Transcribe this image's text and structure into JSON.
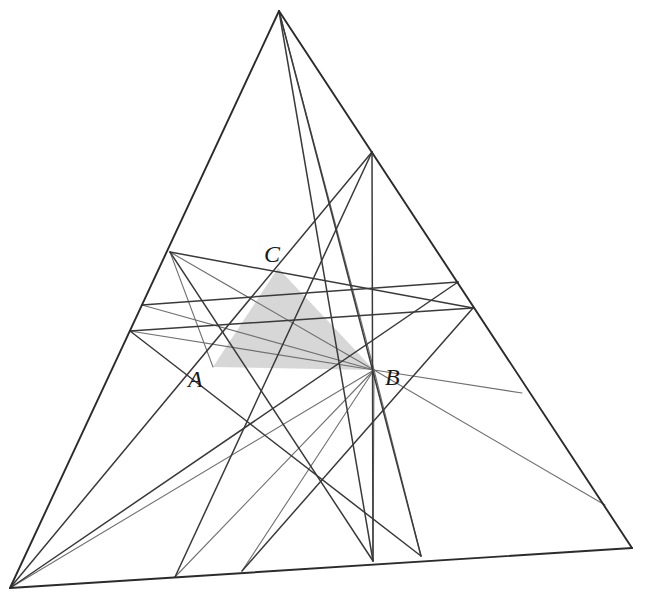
{
  "figure": {
    "kind": "geometric-construction",
    "canvas": {
      "width": 648,
      "height": 601,
      "background": "#ffffff"
    },
    "colors": {
      "outline": "#2b2b2b",
      "cevian_dark": "#3a3a3a",
      "cevian_gray": "#707070",
      "shaded_fill": "#d0d0d0",
      "label": "#1a1a1a"
    },
    "stroke_widths": {
      "outline": 1.9,
      "dark": 1.5,
      "gray": 1.1
    }
  },
  "points": {
    "apex": {
      "name": "P-top",
      "x": 279,
      "y": 11
    },
    "bottom_left": {
      "name": "P-bottom-left",
      "x": 10,
      "y": 588
    },
    "bottom_right": {
      "name": "P-bottom-right",
      "x": 632,
      "y": 548
    },
    "A": {
      "name": "A",
      "x": 213,
      "y": 367
    },
    "B": {
      "name": "B",
      "x": 374,
      "y": 370
    },
    "C": {
      "name": "C",
      "x": 278,
      "y": 268
    },
    "L1": {
      "name": "left-edge-upper",
      "x": 170,
      "y": 252
    },
    "L2": {
      "name": "left-edge-mid",
      "x": 142,
      "y": 305
    },
    "L3": {
      "name": "left-edge-lower",
      "x": 130,
      "y": 331
    },
    "R1": {
      "name": "right-edge-upper",
      "x": 372,
      "y": 152
    },
    "R2": {
      "name": "right-edge-mid",
      "x": 458,
      "y": 282
    },
    "R3": {
      "name": "right-edge-lower",
      "x": 473,
      "y": 308
    },
    "R4": {
      "name": "right-edge-low2",
      "x": 522,
      "y": 393
    },
    "R5": {
      "name": "right-edge-low3",
      "x": 605,
      "y": 505
    },
    "Ba": {
      "name": "base-pt-a",
      "x": 175,
      "y": 577
    },
    "Bb": {
      "name": "base-pt-b",
      "x": 242,
      "y": 571
    },
    "Bc": {
      "name": "base-pt-c",
      "x": 373,
      "y": 561
    },
    "Bd": {
      "name": "base-pt-d",
      "x": 421,
      "y": 556
    }
  },
  "outline_edges": [
    {
      "name": "edge-left",
      "from": "apex",
      "to": "bottom_left"
    },
    {
      "name": "edge-right",
      "from": "apex",
      "to": "bottom_right"
    },
    {
      "name": "edge-bottom",
      "from": "bottom_left",
      "to": "bottom_right"
    }
  ],
  "shaded_triangle": {
    "name": "inner-shaded-triangle",
    "vertices": [
      "A",
      "C",
      "B"
    ],
    "fill": "#d0d0d0",
    "opacity": 0.85
  },
  "dark_cevians": [
    {
      "name": "cevian-apex-to-basec",
      "from": "apex",
      "to": "Bc"
    },
    {
      "name": "cevian-apex-to-based",
      "from": "apex",
      "to": "Bd"
    },
    {
      "name": "cevian-L1-to-basec",
      "from": "L1",
      "to": "Bc"
    },
    {
      "name": "cevian-L1-to-R3",
      "from": "L1",
      "to": "R3"
    },
    {
      "name": "cevian-L2-to-R2",
      "from": "L2",
      "to": "R2"
    },
    {
      "name": "cevian-L3-to-R3",
      "from": "L3",
      "to": "R3"
    },
    {
      "name": "cevian-R1-to-basea",
      "from": "R1",
      "to": "Ba"
    },
    {
      "name": "cevian-R1-to-bottomleft",
      "from": "R1",
      "to": "bottom_left"
    },
    {
      "name": "cevian-R1-to-basec",
      "from": "R1",
      "to": "Bc"
    },
    {
      "name": "cevian-R2-to-bottomleft",
      "from": "R2",
      "to": "bottom_left"
    },
    {
      "name": "cevian-R3-to-baseb",
      "from": "R3",
      "to": "Bb"
    },
    {
      "name": "cevian-L3-to-based",
      "from": "L3",
      "to": "Bd"
    }
  ],
  "gray_cevians": [
    {
      "name": "gray-apex-to-B",
      "from": "apex",
      "to": "B"
    },
    {
      "name": "gray-B-to-basea",
      "from": "B",
      "to": "Ba"
    },
    {
      "name": "gray-B-to-baseb",
      "from": "B",
      "to": "Bb"
    },
    {
      "name": "gray-B-to-basec",
      "from": "B",
      "to": "Bc"
    },
    {
      "name": "gray-B-to-based",
      "from": "B",
      "to": "Bd"
    },
    {
      "name": "gray-B-to-bottomleft",
      "from": "B",
      "to": "bottom_left"
    },
    {
      "name": "gray-B-to-R4",
      "from": "B",
      "to": "R4"
    },
    {
      "name": "gray-B-to-R5",
      "from": "B",
      "to": "R5"
    },
    {
      "name": "gray-B-to-L1",
      "from": "B",
      "to": "L1"
    },
    {
      "name": "gray-B-to-L2",
      "from": "B",
      "to": "L2"
    },
    {
      "name": "gray-B-to-L3",
      "from": "B",
      "to": "L3"
    },
    {
      "name": "gray-L1-to-A",
      "from": "L1",
      "to": "A"
    }
  ],
  "labels": [
    {
      "name": "label-A",
      "text": "A",
      "x": 188,
      "y": 387
    },
    {
      "name": "label-B",
      "text": "B",
      "x": 385,
      "y": 385
    },
    {
      "name": "label-C",
      "text": "C",
      "x": 264,
      "y": 262
    }
  ]
}
